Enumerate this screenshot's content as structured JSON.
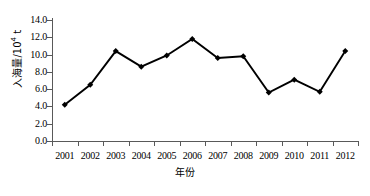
{
  "chart_data": {
    "type": "line",
    "title": "",
    "xlabel": "年份",
    "ylabel": "入海量/10⁴ t",
    "ylabel_text": "入海量/10",
    "ylabel_exp": "4",
    "ylabel_unit": " t",
    "categories": [
      "2001",
      "2002",
      "2003",
      "2004",
      "2005",
      "2006",
      "2007",
      "2008",
      "2009",
      "2010",
      "2011",
      "2012"
    ],
    "values": [
      4.2,
      6.5,
      10.4,
      8.6,
      9.9,
      11.8,
      9.6,
      9.8,
      5.6,
      7.1,
      5.7,
      10.4
    ],
    "series": [
      {
        "name": "入海量",
        "values": [
          4.2,
          6.5,
          10.4,
          8.6,
          9.9,
          11.8,
          9.6,
          9.8,
          5.6,
          7.1,
          5.7,
          10.4
        ]
      }
    ],
    "ylim": [
      0.0,
      14.0
    ],
    "ytick_values": [
      0.0,
      2.0,
      4.0,
      6.0,
      8.0,
      10.0,
      12.0,
      14.0
    ],
    "ytick_labels": [
      "0.0",
      "2.0",
      "4.0",
      "6.0",
      "8.0",
      "10.0",
      "12.0",
      "14.0"
    ],
    "xtick_labels": [
      "2001",
      "2002",
      "2003",
      "2004",
      "2005",
      "2006",
      "2007",
      "2008",
      "2009",
      "2010",
      "2011",
      "2012"
    ],
    "grid": false,
    "legend": false,
    "legend_position": "none",
    "marker": "diamond",
    "line_color": "#000000",
    "marker_color": "#000000",
    "axis_color": "#595959",
    "background_color": "#ffffff"
  }
}
